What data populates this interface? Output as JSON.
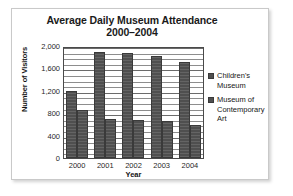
{
  "chart_data": {
    "type": "bar",
    "title": "Average Daily Museum Attendance",
    "subtitle": "2000–2004",
    "xlabel": "Year",
    "ylabel": "Number of Visitors",
    "categories": [
      "2000",
      "2001",
      "2002",
      "2003",
      "2004"
    ],
    "series": [
      {
        "name": "Children's Museum",
        "values": [
          1200,
          1900,
          1880,
          1830,
          1710
        ]
      },
      {
        "name": "Museum of Contemporary Art",
        "values": [
          860,
          700,
          680,
          665,
          590
        ]
      }
    ],
    "ylim": [
      0,
      2000
    ],
    "yticks": [
      "0",
      "400",
      "800",
      "1,200",
      "1,600",
      "2,000"
    ],
    "ytick_values": [
      0,
      400,
      800,
      1200,
      1600,
      2000
    ],
    "minor_gridline_interval": 100,
    "grid": true,
    "legend_position": "right",
    "bar_color": "#4f4f4f",
    "grid_color": "#8d8d8d",
    "axis_color": "#4a4a4a"
  },
  "legend": {
    "entries": [
      {
        "label_line1": "Children's",
        "label_line2": "Museum",
        "label_line3": ""
      },
      {
        "label_line1": "Museum of",
        "label_line2": "Contemporary",
        "label_line3": "Art"
      }
    ]
  }
}
